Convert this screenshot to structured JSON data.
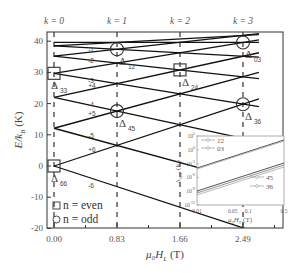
{
  "chart_data": {
    "type": "line",
    "title": "",
    "xlabel": "μ0HL (T)",
    "ylabel": "E/kB (K)",
    "xlim": [
      -0.09,
      3.03
    ],
    "ylim": [
      -20,
      43
    ],
    "x_ticks": [
      "0.00",
      "0.83",
      "1.66",
      "2.49"
    ],
    "y_ticks": [
      "-20",
      "-10",
      "0",
      "10",
      "20",
      "30",
      "40"
    ],
    "top_labels": [
      "k = 0",
      "k = 1",
      "k = 2",
      "k = 3"
    ],
    "grid": false,
    "model": "E_m(H) = D(36 - m^2) + m*D*H/0.83, D = 1.1 K, m = -6..6",
    "series": [
      {
        "name": "m=+6",
        "label": "+6",
        "x": [
          0,
          2.7
        ],
        "y": [
          0,
          21.5
        ]
      },
      {
        "name": "m=-6",
        "label": "-6",
        "x": [
          0,
          2.7
        ],
        "y": [
          0,
          -21.5
        ]
      },
      {
        "name": "m=+5",
        "label": "+5",
        "x": [
          0,
          2.7
        ],
        "y": [
          12.1,
          30.0
        ]
      },
      {
        "name": "m=-5",
        "label": "-5",
        "x": [
          0,
          2.7
        ],
        "y": [
          12.1,
          -5.8
        ]
      },
      {
        "name": "m=+4",
        "label": "+4",
        "x": [
          0,
          2.7
        ],
        "y": [
          22.0,
          36.3
        ]
      },
      {
        "name": "m=-4",
        "label": "-4",
        "x": [
          0,
          2.7
        ],
        "y": [
          22.0,
          7.7
        ]
      },
      {
        "name": "m=+3",
        "label": "+3",
        "x": [
          0,
          2.7
        ],
        "y": [
          29.7,
          40.4
        ]
      },
      {
        "name": "m=-3",
        "label": "-3",
        "x": [
          0,
          2.7
        ],
        "y": [
          29.7,
          19.0
        ]
      },
      {
        "name": "m=+2",
        "label": "+2",
        "x": [
          0,
          2.7
        ],
        "y": [
          35.2,
          42.4
        ]
      },
      {
        "name": "m=-2",
        "label": "-2",
        "x": [
          0,
          2.7
        ],
        "y": [
          35.2,
          28.0
        ]
      },
      {
        "name": "m=+1",
        "label": "+1",
        "x": [
          0,
          2.7
        ],
        "y": [
          38.5,
          42.1
        ]
      },
      {
        "name": "m=-1",
        "label": "-1",
        "x": [
          0,
          2.7
        ],
        "y": [
          38.5,
          34.9
        ]
      },
      {
        "name": "m=0",
        "label": "0",
        "x": [
          0,
          2.7
        ],
        "y": [
          39.6,
          39.6
        ]
      }
    ],
    "annotations": [
      {
        "text": "Δ66",
        "x": 0.0,
        "y": 0,
        "marker": "square"
      },
      {
        "text": "Δ33",
        "x": 0.0,
        "y": 29.7,
        "marker": "square"
      },
      {
        "text": "Δ45",
        "x": 0.83,
        "y": 17.6,
        "marker": "circle"
      },
      {
        "text": "Δ12",
        "x": 0.83,
        "y": 37.4,
        "marker": "circle"
      },
      {
        "text": "Δ24",
        "x": 1.66,
        "y": 30.8,
        "marker": "square"
      },
      {
        "text": "Δ36",
        "x": 2.49,
        "y": 19.8,
        "marker": "circle"
      },
      {
        "text": "Δ03",
        "x": 2.49,
        "y": 39.6,
        "marker": "circle"
      }
    ],
    "legend": [
      {
        "marker": "square",
        "label": "n = even"
      },
      {
        "marker": "circle",
        "label": "n = odd"
      }
    ],
    "legend_position": "lower-left",
    "inset": {
      "type": "line",
      "xscale": "log",
      "yscale": "log",
      "xlabel": "μ0HT (T)",
      "ylabel": "Δmm' (K)",
      "x_ticks": [
        "0.01",
        "0.05",
        "0.1",
        "0.5"
      ],
      "y_ticks": [
        "10^-12",
        "10^-9",
        "10^-6",
        "10^-3",
        "10^0",
        "10^3"
      ],
      "series": [
        {
          "name": "12",
          "label": "1̄2"
        },
        {
          "name": "03",
          "label": "03"
        },
        {
          "name": "45",
          "label": "4̄5"
        },
        {
          "name": "36",
          "label": "3̄6"
        }
      ]
    }
  },
  "labels": {
    "k0": "k = 0",
    "k1": "k = 1",
    "k2": "k = 2",
    "k3": "k = 3",
    "xlabel": "μ₀H",
    "xlabel_sub": "L",
    "xlabel_unit": "(T)",
    "ylabel": "E/k",
    "ylabel_sub": "B",
    "ylabel_unit": "(K)",
    "legend_even": "n = even",
    "legend_odd": "n = odd"
  }
}
